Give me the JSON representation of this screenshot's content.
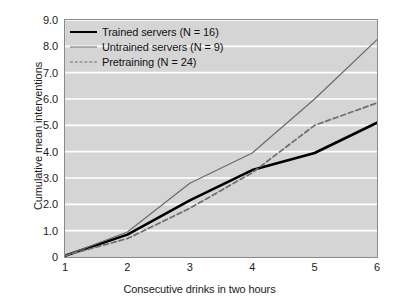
{
  "chart_data": {
    "type": "line",
    "title": "",
    "xlabel": "Consecutive drinks in two hours",
    "ylabel": "Cumulative mean interventions",
    "x": [
      1,
      2,
      3,
      4,
      5,
      6
    ],
    "xlim": [
      1,
      6
    ],
    "ylim": [
      0,
      9
    ],
    "xticklabels": [
      "1",
      "2",
      "3",
      "4",
      "5",
      "6"
    ],
    "yticklabels": [
      "0",
      "1.0",
      "2.0",
      "3.0",
      "4.0",
      "5.0",
      "6.0",
      "7.0",
      "8.0",
      "9.0"
    ],
    "ytickvalues": [
      0,
      1,
      2,
      3,
      4,
      5,
      6,
      7,
      8,
      9
    ],
    "grid": "horizontal-white",
    "legend_position": "upper-left-inside",
    "series": [
      {
        "name": "Trained servers (N = 16)",
        "style": "solid-thick",
        "color": "#000000",
        "values": [
          0.05,
          0.85,
          2.15,
          3.3,
          3.95,
          5.1
        ]
      },
      {
        "name": "Untrained servers (N = 9)",
        "style": "solid-thin",
        "color": "#6b6b6b",
        "values": [
          0.05,
          0.95,
          2.8,
          3.95,
          6.0,
          8.25
        ]
      },
      {
        "name": "Pretraining (N = 24)",
        "style": "dashed",
        "color": "#6e6e6e",
        "values": [
          0.05,
          0.7,
          1.85,
          3.2,
          5.0,
          5.85
        ]
      }
    ]
  },
  "legend": {
    "items": [
      {
        "label": "Trained servers (N = 16)",
        "swatch": "solid-thick-line-icon"
      },
      {
        "label": "Untrained servers (N = 9)",
        "swatch": "solid-thin-line-icon"
      },
      {
        "label": "Pretraining (N = 24)",
        "swatch": "dashed-line-icon"
      }
    ]
  },
  "colors": {
    "plot_background": "#d5d5d5",
    "gridline": "#ffffff",
    "frame": "#8a8a8a",
    "text": "#1a1a1a",
    "trained": "#000000",
    "untrained": "#6b6b6b",
    "pretraining": "#6e6e6e"
  }
}
